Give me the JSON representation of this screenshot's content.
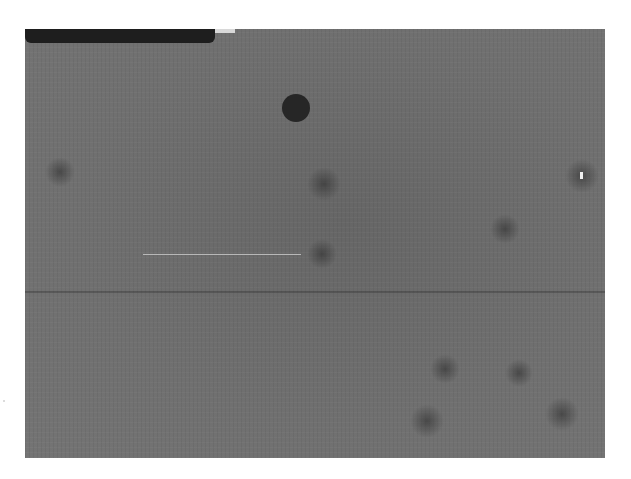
{
  "image": {
    "description": "Grayscale detector/microscopy frame with dark bar at top-left, one large dark circular spot, a hot pixel with dark halo on the right, a faint bright horizontal streak, and several diffuse dark blobs",
    "background_color": "#6f6f6f",
    "features": [
      {
        "name": "top-left-dark-bar",
        "color": "#1e1e1e"
      },
      {
        "name": "large-dark-spot",
        "color": "#262626"
      },
      {
        "name": "hot-pixel",
        "color": "#eeeeee"
      },
      {
        "name": "bright-streak",
        "color": "#b8b8b8"
      }
    ]
  }
}
